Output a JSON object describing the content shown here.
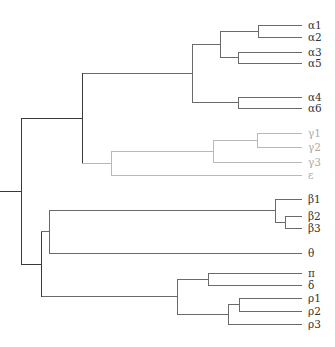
{
  "diagram": {
    "type": "dendrogram",
    "orientation": "left-to-right",
    "colors": {
      "dark": "#3a3a3a",
      "mid": "#6a6a6a",
      "light": "#b8b8b8",
      "label_dark": "#333333",
      "label_light": "#aaaaaa"
    },
    "root": {
      "name": "root",
      "children": [
        {
          "name": "upper-clade",
          "children": [
            {
              "name": "alpha-clade",
              "children": [
                {
                  "name": "alpha-1235",
                  "children": [
                    {
                      "name": "alpha-12",
                      "children": [
                        {
                          "label": "α1"
                        },
                        {
                          "label": "α2"
                        }
                      ]
                    },
                    {
                      "name": "alpha-35",
                      "children": [
                        {
                          "label": "α3"
                        },
                        {
                          "label": "α5"
                        }
                      ]
                    }
                  ]
                },
                {
                  "name": "alpha-46",
                  "children": [
                    {
                      "label": "α4"
                    },
                    {
                      "label": "α6"
                    }
                  ]
                }
              ]
            },
            {
              "name": "gamma-epsilon-clade",
              "tone": "light",
              "children": [
                {
                  "name": "gamma-clade",
                  "children": [
                    {
                      "name": "gamma-12",
                      "children": [
                        {
                          "label": "γ1"
                        },
                        {
                          "label": "γ2"
                        }
                      ]
                    },
                    {
                      "label": "γ3"
                    }
                  ]
                },
                {
                  "label": "ε"
                }
              ]
            }
          ]
        },
        {
          "name": "lower-clade",
          "children": [
            {
              "name": "beta-theta-clade",
              "children": [
                {
                  "name": "beta-clade",
                  "children": [
                    {
                      "label": "β1"
                    },
                    {
                      "name": "beta-23",
                      "children": [
                        {
                          "label": "β2"
                        },
                        {
                          "label": "β3"
                        }
                      ]
                    }
                  ]
                },
                {
                  "label": "θ"
                }
              ]
            },
            {
              "name": "pi-delta-rho-clade",
              "children": [
                {
                  "name": "pi-delta",
                  "children": [
                    {
                      "label": "π"
                    },
                    {
                      "label": "δ"
                    }
                  ]
                },
                {
                  "name": "rho-clade",
                  "children": [
                    {
                      "name": "rho-12",
                      "children": [
                        {
                          "label": "ρ1"
                        },
                        {
                          "label": "ρ2"
                        }
                      ]
                    },
                    {
                      "label": "ρ3"
                    }
                  ]
                }
              ]
            }
          ]
        }
      ]
    },
    "leaf_order": [
      "α1",
      "α2",
      "α3",
      "α5",
      "α4",
      "α6",
      "γ1",
      "γ2",
      "γ3",
      "ε",
      "β1",
      "β2",
      "β3",
      "θ",
      "π",
      "δ",
      "ρ1",
      "ρ2",
      "ρ3"
    ]
  }
}
